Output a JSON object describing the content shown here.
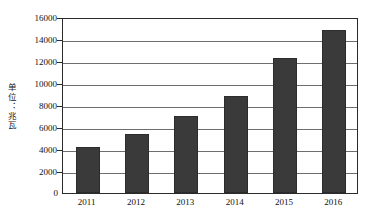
{
  "chart_data": {
    "type": "bar",
    "title": "",
    "subtitle": "",
    "xlabel": "",
    "ylabel": "单位：兆瓦",
    "categories": [
      "2011",
      "2012",
      "2013",
      "2014",
      "2015",
      "2016"
    ],
    "values": [
      4200,
      5400,
      7000,
      8800,
      12300,
      14800
    ],
    "series": [
      {
        "name": "",
        "values": [
          4200,
          5400,
          7000,
          8800,
          12300,
          14800
        ]
      }
    ],
    "ylim": [
      0,
      16000
    ],
    "ytick_values": [
      0,
      2000,
      4000,
      6000,
      8000,
      10000,
      12000,
      14000,
      16000
    ],
    "ytick_labels": [
      "0",
      "2000",
      "4000",
      "6000",
      "8000",
      "10000",
      "12000",
      "14000",
      "16000"
    ],
    "grid": true,
    "grid_axis": "y",
    "legend": false,
    "legend_position": "none",
    "bar_color": "#3a3a3a",
    "background_color": "#ffffff",
    "gridline_color": "#6e6e6e",
    "frame_color": "#2b2b2b",
    "annotations": []
  },
  "axis": {
    "y_unit_label": "单位：兆瓦",
    "zero_label": "0"
  }
}
